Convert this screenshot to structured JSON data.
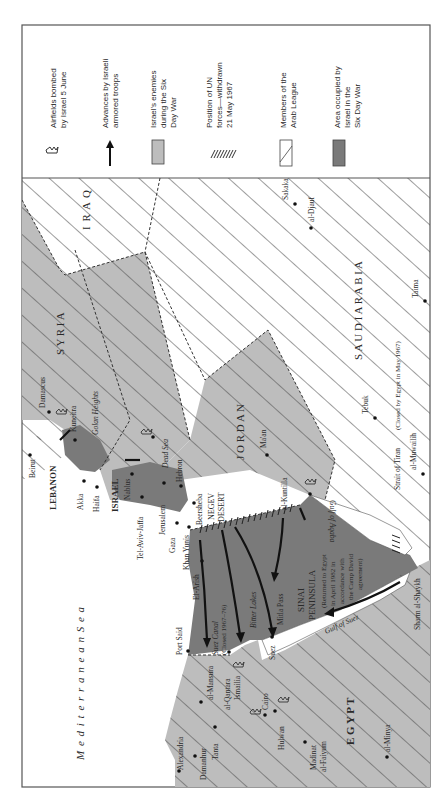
{
  "legend": {
    "items": [
      {
        "id": "airfields",
        "line1": "Airfields bombed",
        "line2": "by Israel 5 June",
        "line3": "",
        "symbol": "airfield-icon"
      },
      {
        "id": "advances",
        "line1": "Advances by Israeli",
        "line2": "armored troops",
        "line3": "",
        "symbol": "arrow-icon"
      },
      {
        "id": "enemies",
        "line1": "Israel's enemies",
        "line2": "during the Six",
        "line3": "Day War",
        "symbol": "light-gray-swatch"
      },
      {
        "id": "un",
        "line1": "Position of UN",
        "line2": "forces—withdrawn",
        "line3": "21 May 1967",
        "symbol": "hatch-ticks"
      },
      {
        "id": "arab_league",
        "line1": "Members of the",
        "line2": "Arab League",
        "line3": "",
        "symbol": "diagonal-hatch-swatch"
      },
      {
        "id": "occupied",
        "line1": "Area occupied by",
        "line2": "Israel in the",
        "line3": "Six Day War",
        "symbol": "dark-gray-swatch"
      }
    ]
  },
  "map": {
    "countries": {
      "iraq": "I R A Q",
      "syria": "S Y R I A",
      "jordan": "J O R D A N",
      "saudi": "S A U D I   A R A B I A",
      "egypt": "E G Y P T",
      "lebanon": "LEBANON",
      "israel": "ISRAEL"
    },
    "regions": {
      "negev1": "NEGEV",
      "negev2": "DESERT",
      "sinai1": "SINAI",
      "sinai2": "PENINSULA",
      "sinai_note1": "(Returned to Egypt",
      "sinai_note2": "in April 1982 in",
      "sinai_note3": "accordance with",
      "sinai_note4": "the Camp David",
      "sinai_note5": "agreement)",
      "golan": "Golan Heights"
    },
    "water": {
      "med": "M e d i t e r r a n e a n   S e a",
      "dead_sea": "Dead Sea",
      "aqaba": "Gulf of Aqaba",
      "suez_gulf": "Gulf of Suez",
      "suez_canal": "Suez Canal",
      "suez_canal_note": "(Closed 1967–76)",
      "bitter": "Bitter Lakes",
      "tiran": "Strait of Tiran",
      "tiran_note": "(Closed by Egypt in May 1967)"
    },
    "cities": {
      "beirut": "Beirut",
      "damascus": "Damascus",
      "kuneitra": "Kuneitra",
      "akka": "Akka",
      "haifa": "Haifa",
      "nablus": "Nablus",
      "telaviv": "Tel-Aviv-Jaffa",
      "jerusalem": "Jerusalem",
      "hebron": "Hebron",
      "beersheba": "Beersheba",
      "gaza": "Gaza",
      "khanyunis": "Khan Yunis",
      "elarish": "El-Arish",
      "portsaid": "Port Said",
      "mitla": "Mitla Pass",
      "kuntilla": "al-Kuntilla",
      "maan": "Ma'an",
      "tebuk": "Tebuk",
      "muwailih": "al-Muwailih",
      "taima": "Taima",
      "sakaka": "Sakaka",
      "djauf": "al-Djauf",
      "sharm": "Sharm al-Shaykh",
      "suez": "Suez",
      "alexandria": "Alexandria",
      "damanhur": "Damanhur",
      "tanta": "Tanta",
      "mansura": "al-Mansura",
      "qantara": "al-Qantara",
      "ismailia": "Ismailia",
      "cairo": "Cairo",
      "hulwan": "Hulwan",
      "faiyum1": "Madinat",
      "faiyum2": "al-Faiyum",
      "minya": "al-Minya"
    }
  },
  "colors": {
    "frame": "#555555",
    "enemy_fill": "#bdbdbd",
    "occupied_fill": "#7a7a7a",
    "hatch": "#4a4a4a",
    "paper": "#ffffff"
  }
}
